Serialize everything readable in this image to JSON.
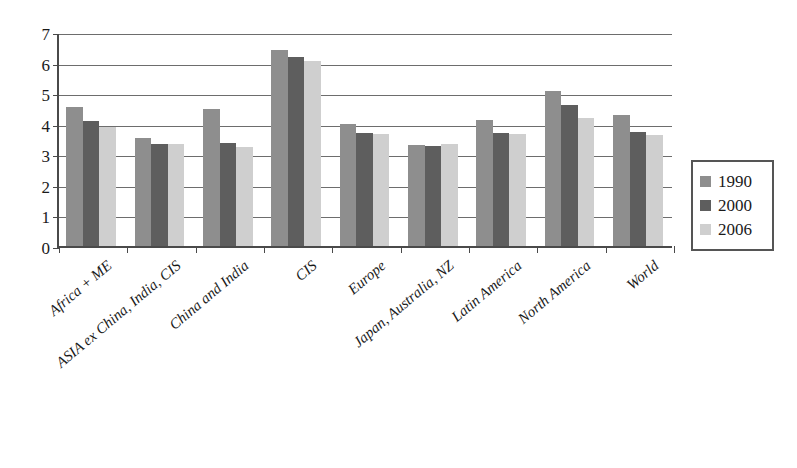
{
  "chart_data": {
    "type": "bar",
    "title": "",
    "subtitle": "",
    "xlabel": "",
    "ylabel": "",
    "ylim": [
      0,
      7
    ],
    "yticks": [
      0,
      1,
      2,
      3,
      4,
      5,
      6,
      7
    ],
    "grid": true,
    "legend_position": "right",
    "categories": [
      "Africa + ME",
      "ASIA ex China, India, CIS",
      "China and India",
      "CIS",
      "Europe",
      "Japan, Australia, NZ",
      "Latin America",
      "North America",
      "World"
    ],
    "series": [
      {
        "name": "1990",
        "color": "#8e8e8e",
        "values": [
          4.55,
          3.52,
          4.48,
          6.4,
          4.0,
          3.3,
          4.12,
          5.08,
          4.28
        ]
      },
      {
        "name": "2000",
        "color": "#5e5e5e",
        "values": [
          4.08,
          3.35,
          3.38,
          6.18,
          3.7,
          3.28,
          3.7,
          4.6,
          3.72
        ]
      },
      {
        "name": "2006",
        "color": "#cfcfcf",
        "values": [
          3.9,
          3.35,
          3.25,
          6.05,
          3.68,
          3.35,
          3.68,
          4.18,
          3.62
        ]
      }
    ],
    "annotations": []
  },
  "legend": {
    "items": [
      {
        "label": "1990",
        "color": "#8e8e8e"
      },
      {
        "label": "2000",
        "color": "#5e5e5e"
      },
      {
        "label": "2006",
        "color": "#cfcfcf"
      }
    ]
  },
  "axis": {
    "y_tick_labels": [
      "0",
      "1",
      "2",
      "3",
      "4",
      "5",
      "6",
      "7"
    ]
  }
}
